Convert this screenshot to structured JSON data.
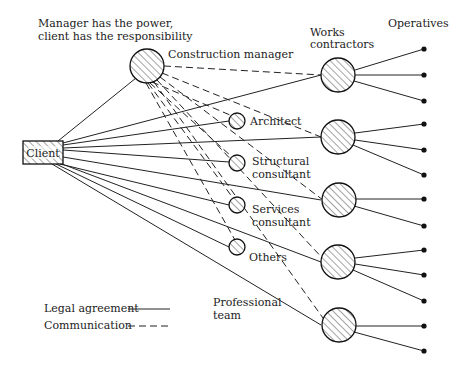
{
  "title_note": {
    "line1": "Manager has the power,",
    "line2": "client has the responsibility"
  },
  "nodes": {
    "client": {
      "label": "Client"
    },
    "construction_manager": {
      "label": "Construction manager"
    },
    "professional_team": {
      "label_line1": "Professional",
      "label_line2": "team",
      "members": [
        {
          "label_line1": "Architect",
          "label_line2": ""
        },
        {
          "label_line1": "Structural",
          "label_line2": "consultant"
        },
        {
          "label_line1": "Services",
          "label_line2": "consultant"
        },
        {
          "label_line1": "Others",
          "label_line2": ""
        }
      ]
    },
    "works_contractors": {
      "label_line1": "Works",
      "label_line2": "contractors",
      "count": 5,
      "operatives_per_contractor": [
        3,
        3,
        2,
        3,
        2
      ]
    },
    "operatives": {
      "label": "Operatives",
      "count": 13
    }
  },
  "legend": {
    "legal_agreement": "Legal agreement",
    "communication": "Communication"
  },
  "colors": {
    "line": "#222222",
    "background": "#ffffff"
  }
}
